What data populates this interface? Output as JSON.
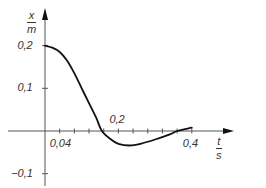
{
  "chart_data": {
    "type": "line",
    "title": "",
    "xlabel": {
      "num": "t",
      "den": "s"
    },
    "ylabel": {
      "num": "x",
      "den": "m"
    },
    "xlim": [
      0,
      0.45
    ],
    "ylim": [
      -0.12,
      0.24
    ],
    "grid": false,
    "legend": null,
    "x_tick_labels": [
      {
        "value": 0.04,
        "label": "0,04"
      },
      {
        "value": 0.2,
        "label": "0,2"
      },
      {
        "value": 0.4,
        "label": "0,4"
      }
    ],
    "x_minor_ticks": [
      0.04,
      0.08,
      0.12,
      0.16,
      0.2,
      0.24,
      0.28,
      0.32,
      0.36,
      0.4
    ],
    "y_tick_labels": [
      {
        "value": 0.2,
        "label": "0,2"
      },
      {
        "value": 0.1,
        "label": "0,1"
      },
      {
        "value": -0.1,
        "label": "−0,1"
      }
    ],
    "series": [
      {
        "name": "x(t)",
        "color": "#111111",
        "x": [
          0,
          0.02,
          0.04,
          0.06,
          0.08,
          0.1,
          0.12,
          0.14,
          0.155,
          0.18,
          0.2,
          0.23,
          0.26,
          0.3,
          0.34,
          0.36,
          0.4
        ],
        "values": [
          0.2,
          0.195,
          0.185,
          0.165,
          0.135,
          0.1,
          0.065,
          0.03,
          0.0,
          -0.02,
          -0.03,
          -0.034,
          -0.03,
          -0.02,
          -0.008,
          0.0,
          0.008
        ]
      }
    ]
  },
  "layout": {
    "origin_px": [
      45,
      131
    ],
    "px_per_x": 367,
    "px_per_y": 427,
    "x_axis_end_px": 234,
    "x_axis_start_px": 8,
    "y_axis_top_px": 8,
    "y_axis_bottom_px": 186
  },
  "colors": {
    "axis": "#555555",
    "curve": "#111111",
    "text": "#333333"
  }
}
